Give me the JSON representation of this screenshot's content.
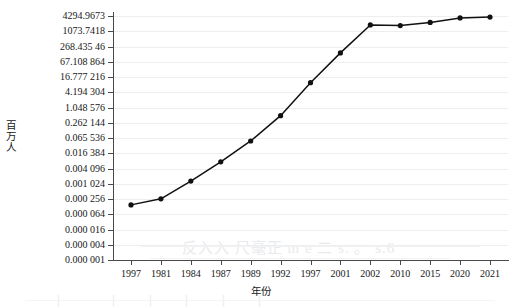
{
  "chart_data": {
    "type": "line",
    "title": "",
    "xlabel": "年份",
    "ylabel": "百万人",
    "yscale": "log4",
    "grid": true,
    "legend": "none",
    "ylim": [
      1e-06,
      4294.9673
    ],
    "ytick_labels": [
      "4294.9673",
      "1073.7418",
      "268.435 46",
      "67.108 864",
      "16.777 216",
      "4.194 304",
      "1.048 576",
      "0.262 144",
      "0.065 536",
      "0.016 384",
      "0.004 096",
      "0.001 024",
      "0.000 256",
      "0.000 064",
      "0.000 016",
      "0.000 004",
      "0.000 001"
    ],
    "ytick_values": [
      4294.9673,
      1073.7418,
      268.43546,
      67.108864,
      16.777216,
      4.194304,
      1.048576,
      0.262144,
      0.065536,
      0.016384,
      0.004096,
      0.001024,
      0.000256,
      6.4e-05,
      1.6e-05,
      4e-06,
      1e-06
    ],
    "categories": [
      "1997",
      "1981",
      "1984",
      "1987",
      "1989",
      "1992",
      "1997",
      "2001",
      "2002",
      "2010",
      "2015",
      "2020",
      "2021"
    ],
    "values": [
      0.00015,
      0.00026,
      0.0013,
      0.0075,
      0.05,
      0.5,
      10.0,
      150.0,
      1900.0,
      1800.0,
      2400.0,
      3600.0,
      3900.0
    ],
    "marker": "filled-circle",
    "line_color": "#111111",
    "marker_color": "#111111",
    "grid_color": "#eceef0",
    "axis_color": "#4a4a4a"
  },
  "artifacts": {
    "top_text": "反入入 尺毫正  m  e  二  s. 。   s.6",
    "right_text": "s.6",
    "bottom_text": "一 丨 一   一 丨 一 丨 一 丨 一  丨 一  丨 一"
  }
}
